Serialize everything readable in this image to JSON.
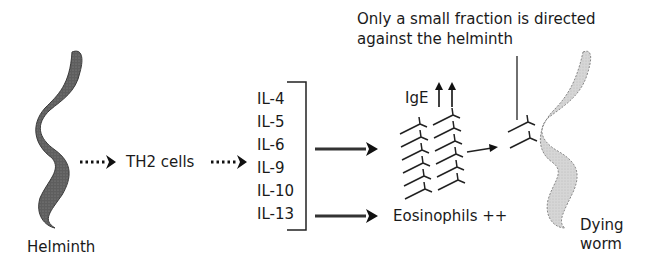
{
  "diagram": {
    "helminth_label": "Helminth",
    "th2_label": "TH2 cells",
    "cytokines": [
      "IL-4",
      "IL-5",
      "IL-6",
      "IL-9",
      "IL-10",
      "IL-13"
    ],
    "ige_label": "IgE",
    "ige_indicator": "↑↑",
    "eosinophils_label": "Eosinophils ++",
    "annotation_line1": "Only a small fraction is directed",
    "annotation_line2": "against the helminth",
    "dying_worm_line1": "Dying",
    "dying_worm_line2": "worm",
    "colors": {
      "helminth_fill": "#6b6b6b",
      "dying_worm_fill": "#d4d4d4",
      "text": "#1a1a1a"
    }
  }
}
